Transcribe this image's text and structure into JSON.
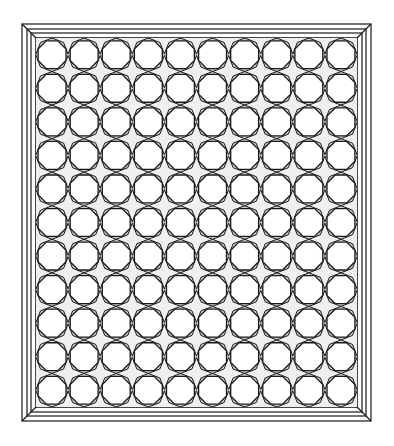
{
  "artwork": {
    "subject": "stained glass panel with octagon and star tiling in a beveled frame",
    "columns": 10,
    "rows": 11,
    "frame": {
      "outer": [
        22,
        24,
        371,
        421
      ],
      "inner": [
        36,
        38,
        357,
        407
      ]
    },
    "colors": {
      "line": "#1a1a1a",
      "fill_glass": "#ffffff",
      "fill_shade": "#c8c8c8",
      "background": "#ffffff"
    }
  }
}
